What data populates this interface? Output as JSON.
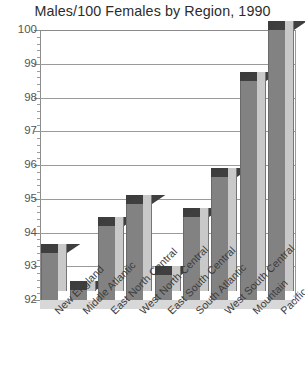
{
  "chart_data": {
    "type": "bar",
    "title": "Males/100 Females by Region, 1990",
    "xlabel": "",
    "ylabel": "",
    "ylim": [
      92,
      100
    ],
    "ytick_step": 1,
    "minor_ticks": true,
    "grid": true,
    "legend": "none",
    "bar_style": "3d-extruded",
    "categories": [
      "New England",
      "Middle Atlantic",
      "East North Central",
      "West North Central",
      "East South Central",
      "South Atlantic",
      "West South Central",
      "Mountain",
      "Pacific"
    ],
    "values": [
      93.4,
      92.3,
      94.2,
      94.85,
      92.75,
      94.45,
      95.65,
      98.5,
      100.0
    ],
    "ytick_labels": [
      "100",
      "99",
      "98",
      "97",
      "96",
      "95",
      "94",
      "93",
      "92"
    ],
    "ytick_values": [
      100,
      99,
      98,
      97,
      96,
      95,
      94,
      93,
      92
    ],
    "colors": {
      "bar_front": "#828282",
      "bar_side": "#c9c9c9",
      "bar_top": "#3d3d3d",
      "gridline": "#9a9a9a",
      "axis": "#8d8d8d",
      "text": "#3a3a3a",
      "background": "#ffffff"
    }
  }
}
